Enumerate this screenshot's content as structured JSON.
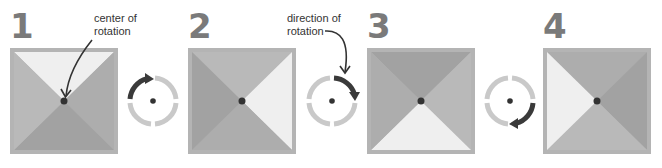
{
  "figure": {
    "colors": {
      "frame": "#b4b4b4",
      "light_triangle": "#efefef",
      "mid_triangle": "#b9b9b9",
      "dark_triangle": "#a2a2a2",
      "side_triangle": "#adadad",
      "center_dot": "#333333",
      "dial_ring": "#c9c9c9",
      "dial_arrow": "#3a3a3a",
      "numeral": "#7a7a7a"
    }
  },
  "steps": [
    {
      "number": "1",
      "light_position": "top"
    },
    {
      "number": "2",
      "light_position": "right"
    },
    {
      "number": "3",
      "light_position": "bottom"
    },
    {
      "number": "4",
      "light_position": "left"
    }
  ],
  "annotations": {
    "center_label_line1": "center of",
    "center_label_line2": "rotation",
    "direction_label_line1": "direction of",
    "direction_label_line2": "rotation"
  },
  "dials": [
    {
      "between": "1-2",
      "arrow_quadrant": "top-left",
      "direction": "clockwise"
    },
    {
      "between": "2-3",
      "arrow_quadrant": "top-right",
      "direction": "clockwise"
    },
    {
      "between": "3-4",
      "arrow_quadrant": "bottom-right",
      "direction": "clockwise"
    }
  ]
}
